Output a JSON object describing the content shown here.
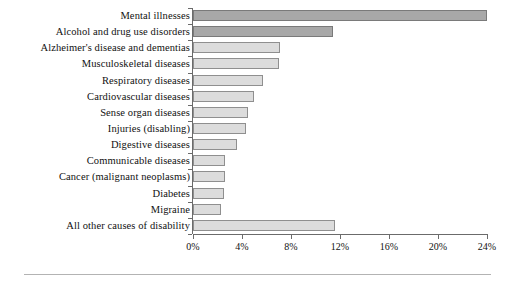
{
  "chart_data": {
    "type": "bar",
    "orientation": "horizontal",
    "title": "",
    "subtitle": "",
    "xlabel": "",
    "ylabel": "",
    "xlim": [
      0,
      24
    ],
    "grid": false,
    "legend": null,
    "axis_tick_labels": [
      "0%",
      "4%",
      "8%",
      "12%",
      "16%",
      "20%",
      "24%"
    ],
    "axis_tick_values": [
      0,
      4,
      8,
      12,
      16,
      20,
      24
    ],
    "categories": [
      "Mental illnesses",
      "Alcohol and drug use disorders",
      "Alzheimer's disease and dementias",
      "Musculoskeletal diseases",
      "Respiratory diseases",
      "Cardiovascular diseases",
      "Sense organ diseases",
      "Injuries (disabling)",
      "Digestive diseases",
      "Communicable diseases",
      "Cancer (malignant neoplasms)",
      "Diabetes",
      "Migraine",
      "All other causes of disability"
    ],
    "values": [
      24.0,
      11.4,
      7.1,
      7.0,
      5.7,
      5.0,
      4.5,
      4.3,
      3.6,
      2.6,
      2.6,
      2.5,
      2.3,
      11.6
    ],
    "highlighted": [
      true,
      true,
      false,
      false,
      false,
      false,
      false,
      false,
      false,
      false,
      false,
      false,
      false,
      false
    ],
    "colors": {
      "bar_fill": "#dcdcdc",
      "bar_fill_highlight": "#a8a8a8",
      "bar_border": "#8f8f8f",
      "bar_border_highlight": "#7a7a7a",
      "axis": "#6b6b6b",
      "text": "#111111",
      "footer_rule": "#b3b3b3"
    }
  }
}
